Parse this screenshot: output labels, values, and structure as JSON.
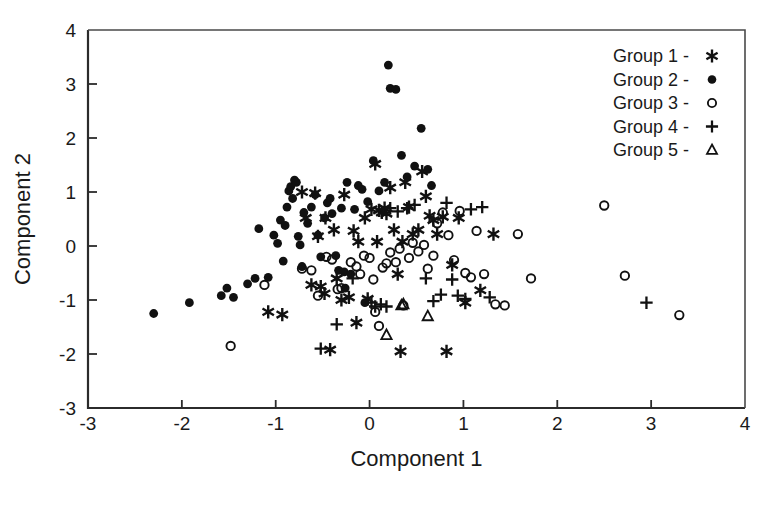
{
  "chart_data": {
    "type": "scatter",
    "title": "",
    "xlabel": "Component 1",
    "ylabel": "Component 2",
    "xlim": [
      -3,
      4
    ],
    "ylim": [
      -3,
      4
    ],
    "xticks": [
      -3,
      -2,
      -1,
      0,
      1,
      2,
      3,
      4
    ],
    "yticks": [
      -3,
      -2,
      -1,
      0,
      1,
      2,
      3,
      4
    ],
    "xticklabels": [
      "-3",
      "-2",
      "-1",
      "0",
      "1",
      "2",
      "3",
      "4"
    ],
    "yticklabels": [
      "-3",
      "-2",
      "-1",
      "0",
      "1",
      "2",
      "3",
      "4"
    ],
    "grid": false,
    "legend_position": "top-right",
    "legend_entries": [
      {
        "label": "Group 1 -",
        "marker": "asterisk"
      },
      {
        "label": "Group 2 -",
        "marker": "filled-circle"
      },
      {
        "label": "Group 3 -",
        "marker": "open-circle"
      },
      {
        "label": "Group 4 -",
        "marker": "plus"
      },
      {
        "label": "Group 5 -",
        "marker": "open-triangle"
      }
    ],
    "series": [
      {
        "name": "Group 1",
        "marker": "asterisk",
        "points": [
          [
            -0.93,
            -1.27
          ],
          [
            -0.62,
            -0.72
          ],
          [
            -0.55,
            0.18
          ],
          [
            -0.47,
            0.52
          ],
          [
            -0.48,
            -0.88
          ],
          [
            -0.42,
            -1.92
          ],
          [
            -0.38,
            0.3
          ],
          [
            -0.35,
            -0.6
          ],
          [
            -0.3,
            -1.0
          ],
          [
            -0.27,
            0.95
          ],
          [
            -0.22,
            -0.95
          ],
          [
            -0.17,
            0.28
          ],
          [
            -0.14,
            -1.42
          ],
          [
            -0.05,
            0.52
          ],
          [
            -0.02,
            -0.98
          ],
          [
            0.02,
            0.68
          ],
          [
            0.06,
            1.52
          ],
          [
            0.1,
            0.66
          ],
          [
            0.13,
            0.62
          ],
          [
            0.16,
            0.7
          ],
          [
            0.18,
            0.6
          ],
          [
            0.22,
            1.08
          ],
          [
            0.26,
            0.3
          ],
          [
            0.3,
            -0.52
          ],
          [
            0.33,
            -1.95
          ],
          [
            0.38,
            1.18
          ],
          [
            0.42,
            0.72
          ],
          [
            0.46,
            0.22
          ],
          [
            0.52,
            0.3
          ],
          [
            0.56,
            1.38
          ],
          [
            0.6,
            0.92
          ],
          [
            0.64,
            0.56
          ],
          [
            0.68,
            0.48
          ],
          [
            0.72,
            0.22
          ],
          [
            0.78,
            0.54
          ],
          [
            0.82,
            -1.95
          ],
          [
            0.88,
            -0.35
          ],
          [
            0.95,
            0.52
          ],
          [
            1.02,
            -1.05
          ],
          [
            1.18,
            -0.82
          ],
          [
            1.32,
            0.22
          ],
          [
            -1.08,
            -1.22
          ],
          [
            -0.72,
            1.0
          ],
          [
            -0.68,
            0.52
          ],
          [
            -0.58,
            0.98
          ],
          [
            -0.52,
            -0.75
          ],
          [
            0.08,
            0.08
          ],
          [
            0.35,
            0.08
          ],
          [
            -0.12,
            0.08
          ]
        ]
      },
      {
        "name": "Group 2",
        "marker": "filled-circle",
        "points": [
          [
            -2.3,
            -1.25
          ],
          [
            -1.92,
            -1.05
          ],
          [
            -1.58,
            -0.92
          ],
          [
            -1.52,
            -0.78
          ],
          [
            -1.3,
            -0.7
          ],
          [
            -1.22,
            -0.6
          ],
          [
            -1.18,
            0.32
          ],
          [
            -1.08,
            -0.58
          ],
          [
            -1.02,
            0.2
          ],
          [
            -0.98,
            0.05
          ],
          [
            -0.95,
            0.48
          ],
          [
            -0.92,
            -0.28
          ],
          [
            -0.9,
            0.38
          ],
          [
            -0.88,
            0.72
          ],
          [
            -0.86,
            1.02
          ],
          [
            -0.84,
            1.1
          ],
          [
            -0.82,
            0.88
          ],
          [
            -0.8,
            1.22
          ],
          [
            -0.78,
            1.18
          ],
          [
            -0.76,
            0.18
          ],
          [
            -0.74,
            0.02
          ],
          [
            -0.72,
            -0.38
          ],
          [
            -0.7,
            0.62
          ],
          [
            -0.66,
            0.42
          ],
          [
            -0.62,
            0.72
          ],
          [
            -0.58,
            0.95
          ],
          [
            -0.55,
            0.2
          ],
          [
            -0.52,
            -0.2
          ],
          [
            -0.48,
            0.52
          ],
          [
            -0.45,
            0.8
          ],
          [
            -0.42,
            0.88
          ],
          [
            -0.4,
            0.6
          ],
          [
            -0.36,
            -0.18
          ],
          [
            -0.33,
            -0.45
          ],
          [
            -0.3,
            0.7
          ],
          [
            -0.27,
            -0.48
          ],
          [
            -0.24,
            1.18
          ],
          [
            -0.2,
            -0.52
          ],
          [
            -0.16,
            0.68
          ],
          [
            -0.12,
            1.12
          ],
          [
            -0.08,
            1.05
          ],
          [
            -0.02,
            0.82
          ],
          [
            0.04,
            1.58
          ],
          [
            0.1,
            1.02
          ],
          [
            0.16,
            1.18
          ],
          [
            0.2,
            3.35
          ],
          [
            0.22,
            2.92
          ],
          [
            0.28,
            2.9
          ],
          [
            0.34,
            1.68
          ],
          [
            0.4,
            1.28
          ],
          [
            0.48,
            1.48
          ],
          [
            0.55,
            2.18
          ],
          [
            0.62,
            1.42
          ],
          [
            0.66,
            1.12
          ],
          [
            -0.05,
            -1.05
          ],
          [
            -1.45,
            -0.95
          ],
          [
            -0.26,
            -0.78
          ]
        ]
      },
      {
        "name": "Group 3",
        "marker": "open-circle",
        "points": [
          [
            -1.48,
            -1.85
          ],
          [
            -1.12,
            -0.72
          ],
          [
            -0.72,
            -0.42
          ],
          [
            -0.55,
            -0.92
          ],
          [
            -0.46,
            -0.2
          ],
          [
            -0.4,
            -0.25
          ],
          [
            -0.34,
            -0.8
          ],
          [
            -0.3,
            -0.78
          ],
          [
            -0.2,
            -0.3
          ],
          [
            -0.14,
            -0.38
          ],
          [
            -0.1,
            -0.52
          ],
          [
            -0.06,
            -0.18
          ],
          [
            0.0,
            -0.22
          ],
          [
            0.06,
            -1.22
          ],
          [
            0.1,
            -1.48
          ],
          [
            0.14,
            -0.4
          ],
          [
            0.18,
            -0.32
          ],
          [
            0.22,
            -0.12
          ],
          [
            0.28,
            -0.3
          ],
          [
            0.32,
            -0.05
          ],
          [
            0.36,
            -1.1
          ],
          [
            0.42,
            -0.22
          ],
          [
            0.46,
            0.06
          ],
          [
            0.52,
            -0.1
          ],
          [
            0.58,
            0.02
          ],
          [
            0.62,
            -0.42
          ],
          [
            0.68,
            -0.18
          ],
          [
            0.72,
            0.42
          ],
          [
            0.78,
            0.62
          ],
          [
            0.84,
            0.2
          ],
          [
            0.9,
            -0.26
          ],
          [
            0.96,
            0.65
          ],
          [
            1.02,
            -0.5
          ],
          [
            1.08,
            -0.58
          ],
          [
            1.14,
            0.28
          ],
          [
            1.22,
            -0.52
          ],
          [
            1.34,
            -1.08
          ],
          [
            1.44,
            -1.1
          ],
          [
            1.58,
            0.22
          ],
          [
            1.72,
            -0.6
          ],
          [
            2.5,
            0.75
          ],
          [
            2.72,
            -0.55
          ],
          [
            3.3,
            -1.28
          ],
          [
            0.04,
            -0.62
          ],
          [
            -0.62,
            -0.45
          ]
        ]
      },
      {
        "name": "Group 4",
        "marker": "plus",
        "points": [
          [
            -0.52,
            -1.9
          ],
          [
            -0.35,
            -1.45
          ],
          [
            -0.18,
            -0.6
          ],
          [
            0.02,
            -1.05
          ],
          [
            0.06,
            -1.12
          ],
          [
            0.12,
            -1.08
          ],
          [
            0.22,
            0.7
          ],
          [
            0.3,
            0.64
          ],
          [
            0.4,
            0.7
          ],
          [
            0.48,
            0.76
          ],
          [
            0.6,
            -0.6
          ],
          [
            0.68,
            -1.02
          ],
          [
            0.76,
            -0.9
          ],
          [
            0.82,
            0.8
          ],
          [
            0.88,
            -0.62
          ],
          [
            0.94,
            -0.92
          ],
          [
            1.02,
            -0.98
          ],
          [
            1.08,
            0.68
          ],
          [
            1.2,
            0.72
          ],
          [
            1.28,
            -0.95
          ],
          [
            2.95,
            -1.05
          ],
          [
            0.18,
            -1.12
          ]
        ]
      },
      {
        "name": "Group 5",
        "marker": "open-triangle",
        "points": [
          [
            0.18,
            -1.65
          ],
          [
            0.34,
            -1.1
          ],
          [
            0.36,
            -1.08
          ],
          [
            0.62,
            -1.3
          ]
        ]
      }
    ]
  },
  "geometry": {
    "plot_left": 88,
    "plot_top": 30,
    "plot_right": 745,
    "plot_bottom": 408
  }
}
